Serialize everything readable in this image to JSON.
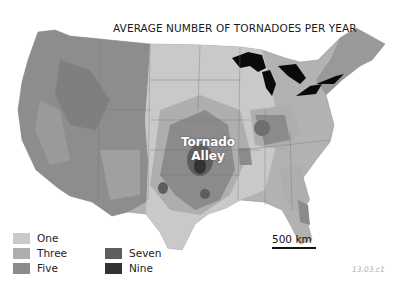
{
  "title": "AVERAGE NUMBER OF TORNADOES PER YEAR",
  "region_label": {
    "line1": "Tornado",
    "line2": "Alley"
  },
  "legend": {
    "items": [
      {
        "label": "One",
        "color": "#c9c9c9"
      },
      {
        "label": "Three",
        "color": "#aeaeae"
      },
      {
        "label": "Five",
        "color": "#8b8b8b"
      },
      {
        "label": "Seven",
        "color": "#5e5e5e"
      },
      {
        "label": "Nine",
        "color": "#333333"
      }
    ]
  },
  "scale": {
    "label": "500 km"
  },
  "figure_code": "13.03.c1",
  "colors": {
    "land": "#b4b4b4",
    "west_relief": "#8e8e8e",
    "lakes": "#0a0a0a",
    "ocean": "#ffffff"
  }
}
